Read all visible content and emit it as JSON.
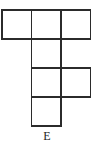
{
  "figure": {
    "label": "E",
    "kind": "square-net-diagram",
    "colors": {
      "background": "#ffffff",
      "stroke": "#2b2b2b",
      "fill": "#ffffff",
      "label": "#1d1d1d"
    },
    "grid": {
      "origin_x": 2,
      "origin_y": 10,
      "cell_size": 29.5,
      "columns": 3,
      "rows": 4
    },
    "cells": [
      {
        "name": "cell-r1c1",
        "row": 0,
        "col": 0,
        "x": 2,
        "y": 10,
        "w": 29.5,
        "h": 29
      },
      {
        "name": "cell-r1c2",
        "row": 0,
        "col": 1,
        "x": 31.5,
        "y": 10,
        "w": 29.5,
        "h": 29
      },
      {
        "name": "cell-r1c3",
        "row": 0,
        "col": 2,
        "x": 61,
        "y": 10,
        "w": 29.5,
        "h": 29
      },
      {
        "name": "cell-r2c2",
        "row": 1,
        "col": 1,
        "x": 31.5,
        "y": 39,
        "w": 29.5,
        "h": 29
      },
      {
        "name": "cell-r3c2",
        "row": 2,
        "col": 1,
        "x": 31.5,
        "y": 68,
        "w": 29.5,
        "h": 29
      },
      {
        "name": "cell-r3c3",
        "row": 2,
        "col": 2,
        "x": 61,
        "y": 68,
        "w": 29.5,
        "h": 29
      },
      {
        "name": "cell-r4c2",
        "row": 3,
        "col": 1,
        "x": 31.5,
        "y": 97,
        "w": 29.5,
        "h": 29
      }
    ]
  }
}
